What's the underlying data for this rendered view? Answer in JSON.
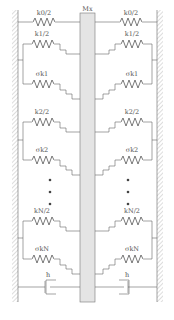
{
  "diagram": {
    "type": "mechanical-spring-mass-model",
    "mass": {
      "label": "Mx",
      "fill": "#e4e4e4"
    },
    "top_springs": {
      "left_label": "k0/2",
      "right_label": "k0/2"
    },
    "groups": [
      {
        "spring_label": "k1/2",
        "gap_spring_label": "σk1"
      },
      {
        "spring_label": "k2/2",
        "gap_spring_label": "σk2"
      },
      {
        "spring_label": "kN/2",
        "gap_spring_label": "σkN"
      }
    ],
    "ellipsis": "• • •",
    "dampers": {
      "left_label": "h",
      "right_label": "h"
    },
    "colors": {
      "line": "#666666",
      "hatch": "#999999",
      "mass": "#e4e4e4",
      "text": "#555555"
    }
  }
}
